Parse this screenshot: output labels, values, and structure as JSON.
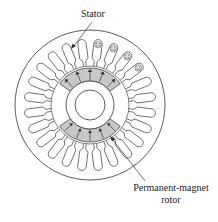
{
  "diagram": {
    "labels": {
      "stator": "Stator",
      "rotor_line1": "Permanent-magnet",
      "rotor_line2": "rotor"
    },
    "geometry": {
      "center": [
        90,
        105
      ],
      "outer_radius": 75,
      "slot_inner_radius": 39,
      "slot_outer_radius": 66,
      "slot_count": 24,
      "magnet_outer_radius": 37,
      "magnet_inner_radius": 24,
      "shaft_radius": 15
    },
    "magnets": [
      {
        "name": "north-pole-segment",
        "start_deg": -145,
        "end_deg": -35,
        "direction": "outward"
      },
      {
        "name": "south-pole-segment",
        "start_deg": 35,
        "end_deg": 145,
        "direction": "inward"
      }
    ],
    "colors": {
      "line": "#333333",
      "magnet_fill": "#c8c8c8",
      "background": "#ffffff"
    }
  }
}
